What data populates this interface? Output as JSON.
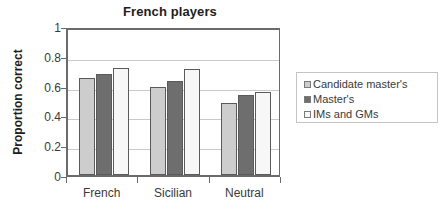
{
  "chart_data": {
    "type": "bar",
    "title": "French players",
    "xlabel": "",
    "ylabel": "Proportion correct",
    "categories": [
      "French",
      "Sicilian",
      "Neutral"
    ],
    "series": [
      {
        "name": "Candidate master's",
        "color": "#cdcdcd",
        "values": [
          0.65,
          0.59,
          0.485
        ]
      },
      {
        "name": "Master's",
        "color": "#6e6e6e",
        "values": [
          0.68,
          0.63,
          0.54
        ]
      },
      {
        "name": "IMs and GMs",
        "color": "#f7f7f7",
        "values": [
          0.72,
          0.71,
          0.555
        ]
      }
    ],
    "ylim": [
      0,
      1
    ],
    "yticks": [
      "0",
      "0.2",
      "0.4",
      "0.6",
      "0.8",
      "1"
    ],
    "ytick_values": [
      0,
      0.2,
      0.4,
      0.6,
      0.8,
      1
    ],
    "grid": true,
    "legend_position": "right"
  },
  "legend": {
    "items": [
      {
        "label": "Candidate master's"
      },
      {
        "label": "Master's"
      },
      {
        "label": "IMs and GMs"
      }
    ]
  }
}
